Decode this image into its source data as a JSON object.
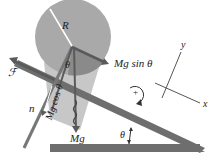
{
  "diagram": {
    "labels": {
      "radius": "R",
      "friction": "ℱ",
      "normal": "n",
      "gravity": "Mg",
      "gravity_parallel": "Mg sin θ",
      "gravity_perpendicular": "Mg cos θ",
      "angle_at_center": "θ",
      "incline_angle": "θ",
      "axis_x": "x",
      "axis_y": "y",
      "rotation_sign": "+"
    },
    "colors": {
      "cylinder": "#a9a9a9",
      "cylinder_shadow": "#8c8c8c",
      "incline": "#6e6e6e",
      "arrow": "#5a5a5a",
      "text": "#222222",
      "background": "#ffffff"
    }
  }
}
